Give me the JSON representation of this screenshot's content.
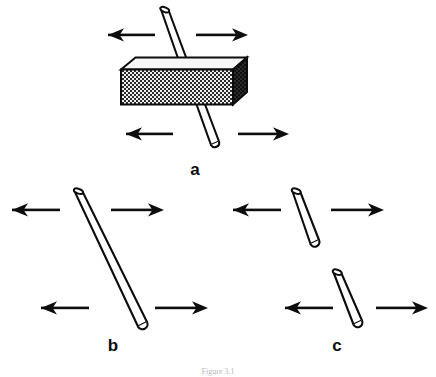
{
  "figure": {
    "caption": "Figure 3.1",
    "background_color": "#ffffff",
    "ink_color": "#0d0d0d",
    "panels": [
      {
        "id": "a",
        "label": "a",
        "description": "rod passing through a hatched rectangular block",
        "elements": {
          "block": {
            "name": "hatched-block",
            "fill_pattern": "checkerboard",
            "front_face_color": "#3a3a3a",
            "top_face_color": "#f2f2f2",
            "side_face_color": "#1a1a1a"
          },
          "rods": 1,
          "arrows": [
            {
              "direction": "left",
              "position": "upper-left"
            },
            {
              "direction": "right",
              "position": "upper-right"
            },
            {
              "direction": "left",
              "position": "lower-left"
            },
            {
              "direction": "right",
              "position": "lower-right"
            }
          ]
        }
      },
      {
        "id": "b",
        "label": "b",
        "description": "single long tilted rod, unbroken",
        "elements": {
          "rods": 1,
          "arrows": [
            {
              "direction": "left",
              "position": "upper-left"
            },
            {
              "direction": "right",
              "position": "upper-right"
            },
            {
              "direction": "left",
              "position": "lower-left"
            },
            {
              "direction": "right",
              "position": "lower-right"
            }
          ]
        }
      },
      {
        "id": "c",
        "label": "c",
        "description": "two separate short rod segments, broken apart",
        "elements": {
          "rods": 2,
          "arrows": [
            {
              "direction": "left",
              "position": "upper-left"
            },
            {
              "direction": "right",
              "position": "upper-right"
            },
            {
              "direction": "left",
              "position": "lower-left"
            },
            {
              "direction": "right",
              "position": "lower-right"
            }
          ]
        }
      }
    ]
  }
}
